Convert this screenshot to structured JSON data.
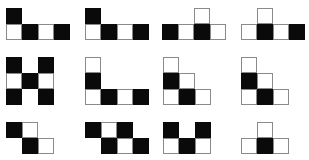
{
  "puzzle": {
    "cell_size": 16,
    "colors": {
      "black": "#0a0a0a",
      "white": "#ffffff",
      "border": "#8a8a8a"
    },
    "figures": [
      {
        "id": 1,
        "x": 6,
        "y": 8,
        "cells": [
          [
            0,
            0,
            "black"
          ],
          [
            1,
            0,
            "white"
          ],
          [
            1,
            1,
            "black"
          ],
          [
            1,
            2,
            "white"
          ],
          [
            1,
            3,
            "black"
          ]
        ]
      },
      {
        "id": 2,
        "x": 85,
        "y": 8,
        "cells": [
          [
            0,
            0,
            "black"
          ],
          [
            1,
            0,
            "white"
          ],
          [
            1,
            1,
            "black"
          ],
          [
            1,
            2,
            "white"
          ],
          [
            1,
            3,
            "black"
          ]
        ]
      },
      {
        "id": 3,
        "x": 162,
        "y": 8,
        "cells": [
          [
            0,
            2,
            "white"
          ],
          [
            1,
            0,
            "black"
          ],
          [
            1,
            1,
            "white"
          ],
          [
            1,
            2,
            "black"
          ],
          [
            1,
            3,
            "white"
          ]
        ]
      },
      {
        "id": 4,
        "x": 241,
        "y": 8,
        "cells": [
          [
            0,
            1,
            "white"
          ],
          [
            1,
            0,
            "white"
          ],
          [
            1,
            1,
            "black"
          ],
          [
            1,
            2,
            "white"
          ],
          [
            1,
            3,
            "black"
          ]
        ]
      },
      {
        "id": 5,
        "x": 6,
        "y": 57,
        "cells": [
          [
            0,
            0,
            "black"
          ],
          [
            1,
            0,
            "white"
          ],
          [
            2,
            0,
            "black"
          ],
          [
            1,
            1,
            "black"
          ],
          [
            0,
            2,
            "black"
          ],
          [
            1,
            2,
            "white"
          ],
          [
            2,
            2,
            "black"
          ]
        ]
      },
      {
        "id": 6,
        "x": 85,
        "y": 57,
        "cells": [
          [
            0,
            0,
            "white"
          ],
          [
            1,
            0,
            "black"
          ],
          [
            2,
            0,
            "white"
          ],
          [
            2,
            1,
            "black"
          ],
          [
            2,
            2,
            "white"
          ],
          [
            2,
            3,
            "black"
          ]
        ]
      },
      {
        "id": 7,
        "x": 163,
        "y": 57,
        "cells": [
          [
            0,
            0,
            "white"
          ],
          [
            1,
            0,
            "black"
          ],
          [
            1,
            1,
            "white"
          ],
          [
            2,
            0,
            "white"
          ],
          [
            2,
            1,
            "black"
          ],
          [
            2,
            2,
            "white"
          ]
        ]
      },
      {
        "id": 8,
        "x": 241,
        "y": 57,
        "cells": [
          [
            0,
            0,
            "white"
          ],
          [
            1,
            0,
            "black"
          ],
          [
            1,
            1,
            "white"
          ],
          [
            2,
            0,
            "white"
          ],
          [
            2,
            1,
            "black"
          ],
          [
            2,
            2,
            "white"
          ]
        ]
      },
      {
        "id": 9,
        "x": 6,
        "y": 122,
        "cells": [
          [
            0,
            0,
            "black"
          ],
          [
            0,
            1,
            "white"
          ],
          [
            1,
            1,
            "black"
          ],
          [
            1,
            2,
            "white"
          ]
        ]
      },
      {
        "id": 10,
        "x": 85,
        "y": 122,
        "cells": [
          [
            0,
            0,
            "black"
          ],
          [
            0,
            1,
            "white"
          ],
          [
            0,
            2,
            "black"
          ],
          [
            1,
            1,
            "black"
          ],
          [
            1,
            2,
            "white"
          ],
          [
            1,
            3,
            "black"
          ]
        ]
      },
      {
        "id": 11,
        "x": 163,
        "y": 122,
        "cells": [
          [
            0,
            0,
            "black"
          ],
          [
            0,
            2,
            "black"
          ],
          [
            1,
            0,
            "white"
          ],
          [
            1,
            1,
            "black"
          ],
          [
            1,
            2,
            "white"
          ]
        ]
      },
      {
        "id": 12,
        "x": 241,
        "y": 122,
        "cells": [
          [
            0,
            1,
            "white"
          ],
          [
            1,
            0,
            "white"
          ],
          [
            1,
            1,
            "black"
          ],
          [
            1,
            2,
            "white"
          ]
        ]
      }
    ]
  }
}
